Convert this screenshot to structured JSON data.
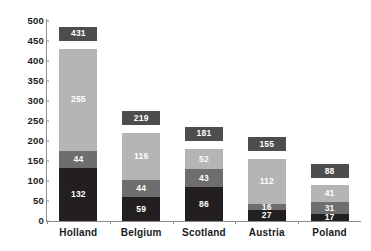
{
  "chart_data": {
    "type": "bar",
    "subtype": "stacked-bar",
    "title": "",
    "subtitle": "",
    "xlabel": "",
    "ylabel": "",
    "ylim": [
      0,
      500
    ],
    "ytick_step": 50,
    "ytick_labels": [
      "500",
      "450",
      "400",
      "350",
      "300",
      "250",
      "200",
      "150",
      "100",
      "50",
      "0"
    ],
    "ytick_values": [
      500,
      450,
      400,
      350,
      300,
      250,
      200,
      150,
      100,
      50,
      0
    ],
    "grid": false,
    "legend": "none",
    "categories": [
      "Holland",
      "Belgium",
      "Scotland",
      "Austria",
      "Poland"
    ],
    "series": [
      {
        "name": "bottom-segment",
        "color": "#231f20",
        "values": [
          132,
          59,
          86,
          27,
          17
        ]
      },
      {
        "name": "middle-segment",
        "color": "#6e6e6e",
        "values": [
          44,
          44,
          43,
          16,
          31
        ]
      },
      {
        "name": "top-segment",
        "color": "#b5b5b5",
        "values": [
          255,
          116,
          52,
          112,
          41
        ]
      }
    ],
    "totals": [
      431,
      219,
      181,
      155,
      88
    ],
    "total_label_color": "#4d4d4d",
    "axis_color": "#8c8c8c",
    "background": "#ffffff",
    "bars": [
      {
        "category": "Holland",
        "total": 431,
        "total_text": "431",
        "segments": [
          {
            "value": 132,
            "text": "132",
            "color": "#231f20"
          },
          {
            "value": 44,
            "text": "44",
            "color": "#6e6e6e"
          },
          {
            "value": 255,
            "text": "255",
            "color": "#b5b5b5"
          }
        ]
      },
      {
        "category": "Belgium",
        "total": 219,
        "total_text": "219",
        "segments": [
          {
            "value": 59,
            "text": "59",
            "color": "#231f20"
          },
          {
            "value": 44,
            "text": "44",
            "color": "#6e6e6e"
          },
          {
            "value": 116,
            "text": "116",
            "color": "#b5b5b5"
          }
        ]
      },
      {
        "category": "Scotland",
        "total": 181,
        "total_text": "181",
        "segments": [
          {
            "value": 86,
            "text": "86",
            "color": "#231f20"
          },
          {
            "value": 43,
            "text": "43",
            "color": "#6e6e6e"
          },
          {
            "value": 52,
            "text": "52",
            "color": "#b5b5b5"
          }
        ]
      },
      {
        "category": "Austria",
        "total": 155,
        "total_text": "155",
        "segments": [
          {
            "value": 27,
            "text": "27",
            "color": "#231f20"
          },
          {
            "value": 16,
            "text": "16",
            "color": "#6e6e6e"
          },
          {
            "value": 112,
            "text": "112",
            "color": "#b5b5b5"
          }
        ]
      },
      {
        "category": "Poland",
        "total": 88,
        "total_text": "88",
        "segments": [
          {
            "value": 17,
            "text": "17",
            "color": "#231f20"
          },
          {
            "value": 31,
            "text": "31",
            "color": "#6e6e6e"
          },
          {
            "value": 41,
            "text": "41",
            "color": "#b5b5b5"
          }
        ]
      }
    ]
  }
}
